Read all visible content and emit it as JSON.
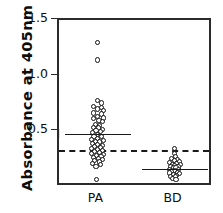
{
  "chart_data": {
    "type": "scatter",
    "title": "",
    "xlabel": "",
    "ylabel": "Absorbance  at  405nm",
    "ylim": [
      0.0,
      1.5
    ],
    "yticks": [
      0.5,
      1.0,
      1.5
    ],
    "ytick_labels": [
      "0.5",
      "1.0",
      "1.5"
    ],
    "grid": false,
    "legend": "none",
    "categories": [
      "PA",
      "BD"
    ],
    "annotations": [
      {
        "label": "M",
        "group": "PA",
        "value": 0.48,
        "type": "mean-line"
      },
      {
        "label": "M",
        "group": "BD",
        "value": 0.165,
        "type": "mean-line"
      },
      {
        "label": "",
        "group": "all",
        "value": 0.335,
        "type": "cutoff-dashed-line"
      }
    ],
    "series": [
      {
        "name": "PA",
        "x_center": 0.5,
        "mean": 0.48,
        "n": 54,
        "points": [
          {
            "v": 1.3,
            "o": 0.0
          },
          {
            "v": 1.14,
            "o": 0.0
          },
          {
            "v": 0.78,
            "o": 0.0
          },
          {
            "v": 0.755,
            "o": 0.055
          },
          {
            "v": 0.725,
            "o": -0.055
          },
          {
            "v": 0.715,
            "o": 0.05
          },
          {
            "v": 0.7,
            "o": 0.0
          },
          {
            "v": 0.685,
            "o": 0.075
          },
          {
            "v": 0.665,
            "o": -0.05
          },
          {
            "v": 0.655,
            "o": 0.055
          },
          {
            "v": 0.635,
            "o": 0.0
          },
          {
            "v": 0.62,
            "o": 0.075
          },
          {
            "v": 0.615,
            "o": -0.055
          },
          {
            "v": 0.6,
            "o": 0.02
          },
          {
            "v": 0.585,
            "o": 0.06
          },
          {
            "v": 0.565,
            "o": -0.03
          },
          {
            "v": 0.555,
            "o": 0.03
          },
          {
            "v": 0.535,
            "o": -0.055
          },
          {
            "v": 0.53,
            "o": 0.015
          },
          {
            "v": 0.515,
            "o": 0.06
          },
          {
            "v": 0.505,
            "o": -0.02
          },
          {
            "v": 0.495,
            "o": 0.035
          },
          {
            "v": 0.49,
            "o": -0.06
          },
          {
            "v": 0.47,
            "o": 0.0
          },
          {
            "v": 0.455,
            "o": -0.045
          },
          {
            "v": 0.45,
            "o": 0.05
          },
          {
            "v": 0.435,
            "o": 0.0
          },
          {
            "v": 0.425,
            "o": -0.075
          },
          {
            "v": 0.42,
            "o": 0.075
          },
          {
            "v": 0.41,
            "o": -0.03
          },
          {
            "v": 0.405,
            "o": 0.03
          },
          {
            "v": 0.39,
            "o": -0.065
          },
          {
            "v": 0.385,
            "o": 0.0
          },
          {
            "v": 0.375,
            "o": 0.065
          },
          {
            "v": 0.365,
            "o": -0.035
          },
          {
            "v": 0.355,
            "o": 0.035
          },
          {
            "v": 0.345,
            "o": -0.075
          },
          {
            "v": 0.34,
            "o": 0.005
          },
          {
            "v": 0.33,
            "o": 0.07
          },
          {
            "v": 0.32,
            "o": -0.04
          },
          {
            "v": 0.31,
            "o": 0.03
          },
          {
            "v": 0.3,
            "o": -0.08
          },
          {
            "v": 0.295,
            "o": 0.075
          },
          {
            "v": 0.285,
            "o": -0.015
          },
          {
            "v": 0.275,
            "o": 0.045
          },
          {
            "v": 0.265,
            "o": -0.055
          },
          {
            "v": 0.255,
            "o": 0.01
          },
          {
            "v": 0.245,
            "o": 0.06
          },
          {
            "v": 0.235,
            "o": -0.035
          },
          {
            "v": 0.225,
            "o": 0.025
          },
          {
            "v": 0.21,
            "o": -0.06
          },
          {
            "v": 0.2,
            "o": 0.035
          },
          {
            "v": 0.185,
            "o": -0.02
          },
          {
            "v": 0.065,
            "o": -0.01
          }
        ]
      },
      {
        "name": "BD",
        "x_center": 1.5,
        "mean": 0.165,
        "n": 29,
        "points": [
          {
            "v": 0.345,
            "o": 0.0
          },
          {
            "v": 0.3,
            "o": -0.005
          },
          {
            "v": 0.275,
            "o": 0.015
          },
          {
            "v": 0.255,
            "o": -0.04
          },
          {
            "v": 0.245,
            "o": 0.035
          },
          {
            "v": 0.235,
            "o": -0.005
          },
          {
            "v": 0.225,
            "o": 0.065
          },
          {
            "v": 0.22,
            "o": -0.065
          },
          {
            "v": 0.21,
            "o": 0.025
          },
          {
            "v": 0.205,
            "o": -0.03
          },
          {
            "v": 0.2,
            "o": 0.075
          },
          {
            "v": 0.195,
            "o": 0.005
          },
          {
            "v": 0.185,
            "o": -0.055
          },
          {
            "v": 0.18,
            "o": 0.045
          },
          {
            "v": 0.175,
            "o": -0.015
          },
          {
            "v": 0.17,
            "o": 0.02
          },
          {
            "v": 0.16,
            "o": -0.06
          },
          {
            "v": 0.155,
            "o": 0.055
          },
          {
            "v": 0.145,
            "o": 0.0
          },
          {
            "v": 0.14,
            "o": -0.035
          },
          {
            "v": 0.13,
            "o": 0.035
          },
          {
            "v": 0.125,
            "o": -0.07
          },
          {
            "v": 0.12,
            "o": 0.07
          },
          {
            "v": 0.11,
            "o": -0.015
          },
          {
            "v": 0.105,
            "o": 0.03
          },
          {
            "v": 0.095,
            "o": -0.05
          },
          {
            "v": 0.09,
            "o": 0.015
          },
          {
            "v": 0.075,
            "o": -0.025
          },
          {
            "v": 0.065,
            "o": 0.02
          }
        ]
      }
    ]
  }
}
